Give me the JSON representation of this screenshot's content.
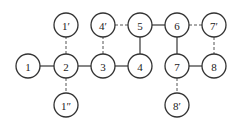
{
  "diagram": {
    "type": "graph",
    "node_radius": 12,
    "nodes": [
      {
        "id": "n1",
        "label": "1",
        "x": 28,
        "y": 66
      },
      {
        "id": "n2",
        "label": "2",
        "x": 66,
        "y": 66
      },
      {
        "id": "n3",
        "label": "3",
        "x": 103,
        "y": 66
      },
      {
        "id": "n4",
        "label": "4",
        "x": 140,
        "y": 66
      },
      {
        "id": "n1p",
        "label": "1′",
        "x": 66,
        "y": 25
      },
      {
        "id": "n4p",
        "label": "4′",
        "x": 103,
        "y": 25
      },
      {
        "id": "n5",
        "label": "5",
        "x": 140,
        "y": 25
      },
      {
        "id": "n6",
        "label": "6",
        "x": 177,
        "y": 25
      },
      {
        "id": "n7p",
        "label": "7′",
        "x": 214,
        "y": 25
      },
      {
        "id": "n7",
        "label": "7",
        "x": 177,
        "y": 66
      },
      {
        "id": "n8",
        "label": "8",
        "x": 214,
        "y": 66
      },
      {
        "id": "n1pp",
        "label": "1″",
        "x": 66,
        "y": 105
      },
      {
        "id": "n8p",
        "label": "8′",
        "x": 177,
        "y": 105
      }
    ],
    "edges": [
      {
        "from": "n1",
        "to": "n2",
        "style": "solid"
      },
      {
        "from": "n2",
        "to": "n3",
        "style": "solid"
      },
      {
        "from": "n3",
        "to": "n4",
        "style": "solid"
      },
      {
        "from": "n4",
        "to": "n5",
        "style": "solid"
      },
      {
        "from": "n5",
        "to": "n6",
        "style": "solid"
      },
      {
        "from": "n6",
        "to": "n7",
        "style": "solid"
      },
      {
        "from": "n7",
        "to": "n8",
        "style": "solid"
      },
      {
        "from": "n2",
        "to": "n1p",
        "style": "dashed"
      },
      {
        "from": "n2",
        "to": "n1pp",
        "style": "dashed"
      },
      {
        "from": "n3",
        "to": "n4p",
        "style": "dashed"
      },
      {
        "from": "n4p",
        "to": "n5",
        "style": "dashed"
      },
      {
        "from": "n6",
        "to": "n7p",
        "style": "dashed"
      },
      {
        "from": "n7p",
        "to": "n8",
        "style": "dashed"
      },
      {
        "from": "n7",
        "to": "n8p",
        "style": "dashed"
      }
    ]
  }
}
